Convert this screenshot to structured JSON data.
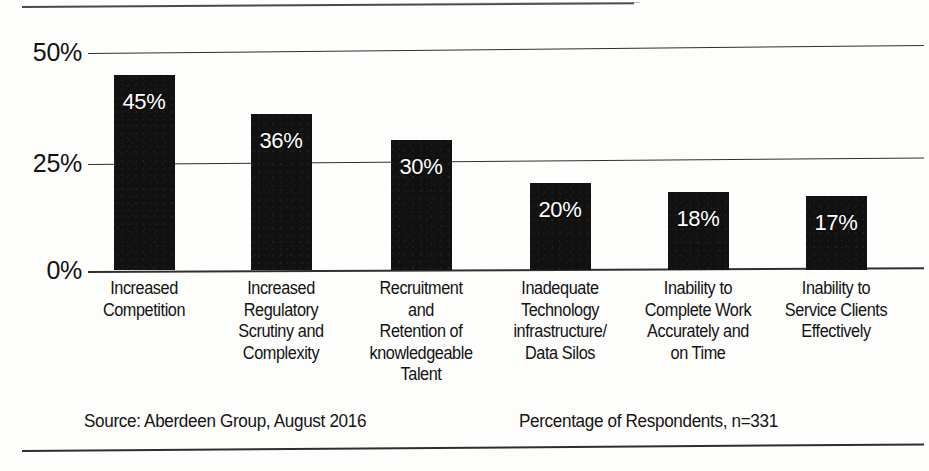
{
  "chart_data": {
    "type": "bar",
    "title": "",
    "subtitle": "",
    "xlabel": "",
    "ylabel": "",
    "ylim": [
      0,
      50
    ],
    "grid": true,
    "legend": "none",
    "orientation": "vertical",
    "bar_color": "#111111",
    "value_label_color": "#ffffff",
    "yticks": [
      "0%",
      "25%",
      "50%"
    ],
    "ytick_values": [
      0,
      25,
      50
    ],
    "categories": [
      "Increased\nCompetition",
      "Increased\nRegulatory\nScrutiny and\nComplexity",
      "Recruitment\nand\nRetention of\nknowledgeable\nTalent",
      "Inadequate\nTechnology\ninfrastructure/\nData Silos",
      "Inability to\nComplete Work\nAccurately and\non Time",
      "Inability to\nService Clients\nEffectively"
    ],
    "values": [
      45,
      36,
      30,
      20,
      18,
      17
    ],
    "data_labels": [
      "45%",
      "36%",
      "30%",
      "20%",
      "18%",
      "17%"
    ]
  },
  "axis": {
    "yticks": [
      {
        "label": "50%",
        "value": 50
      },
      {
        "label": "25%",
        "value": 25
      },
      {
        "label": "0%",
        "value": 0
      }
    ]
  },
  "bars": [
    {
      "value": 45,
      "label": "45%",
      "category_lines": [
        "Increased",
        "Competition"
      ]
    },
    {
      "value": 36,
      "label": "36%",
      "category_lines": [
        "Increased",
        "Regulatory",
        "Scrutiny and",
        "Complexity"
      ]
    },
    {
      "value": 30,
      "label": "30%",
      "category_lines": [
        "Recruitment",
        "and",
        "Retention of",
        "knowledgeable",
        "Talent"
      ]
    },
    {
      "value": 20,
      "label": "20%",
      "category_lines": [
        "Inadequate",
        "Technology",
        "infrastructure/",
        "Data Silos"
      ]
    },
    {
      "value": 18,
      "label": "18%",
      "category_lines": [
        "Inability to",
        "Complete Work",
        "Accurately and",
        "on Time"
      ]
    },
    {
      "value": 17,
      "label": "17%",
      "category_lines": [
        "Inability to",
        "Service Clients",
        "Effectively"
      ]
    }
  ],
  "footer": {
    "source": "Source: Aberdeen Group, August 2016",
    "respondents": "Percentage of Respondents, n=331"
  },
  "colors": {
    "bar": "#111111",
    "text": "#121212",
    "rule": "#2b2b2b",
    "page_background": "#fdfdfc"
  }
}
